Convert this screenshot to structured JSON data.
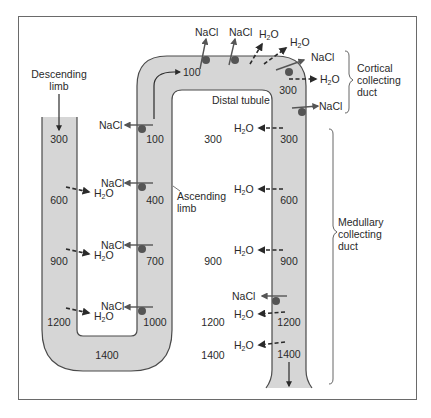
{
  "figure": {
    "colors": {
      "tube_fill": "#d6d6d6",
      "tube_stroke": "#4a4a4a",
      "frame": "#6a6a6a",
      "pump_dot": "#555555",
      "arrow": "#2a2a2a",
      "text": "#2a2a2a"
    }
  },
  "labels": {
    "descending_limb": [
      "Descending",
      "limb"
    ],
    "ascending_limb": [
      "Ascending",
      "limb"
    ],
    "distal_tubule": "Distal tubule",
    "cortical_collecting_duct": [
      "Cortical",
      "collecting",
      "duct"
    ],
    "medullary_collecting_duct": [
      "Medullary",
      "collecting",
      "duct"
    ]
  },
  "osmolarity": {
    "descending_limb": [
      "300",
      "600",
      "900",
      "1200"
    ],
    "loop_bottom": "1400",
    "ascending_limb": [
      "100",
      "400",
      "700",
      "1000"
    ],
    "distal_tubule_start": "100",
    "cortical_duct": "300",
    "collecting_duct": [
      "300",
      "600",
      "900",
      "1200",
      "1400"
    ],
    "interstitium": [
      "300",
      "900",
      "1200",
      "1400"
    ]
  },
  "solutes": {
    "nacl": "NaCl",
    "h2o_h": "H",
    "h2o_sub": "2",
    "h2o_o": "O"
  }
}
